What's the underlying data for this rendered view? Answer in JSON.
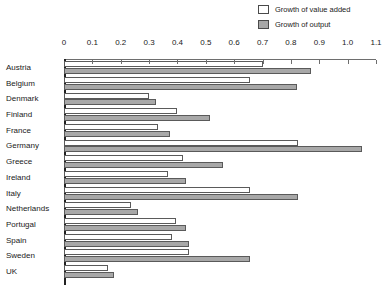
{
  "chart_data": {
    "type": "bar",
    "orientation": "horizontal",
    "title": "",
    "xlabel": "",
    "ylabel": "",
    "xlim": [
      0,
      1.1
    ],
    "grid": false,
    "legend_position": "top-right",
    "tick_labels": [
      "0",
      "0.1",
      "0.2",
      "0.3",
      "0.4",
      "0.5",
      "0.6",
      "0.7",
      "0.8",
      "0.9",
      "1.0",
      "1.1"
    ],
    "tick_values": [
      0,
      0.1,
      0.2,
      0.3,
      0.4,
      0.5,
      0.6,
      0.7,
      0.8,
      0.9,
      1.0,
      1.1
    ],
    "categories": [
      "Austria",
      "Belgium",
      "Denmark",
      "Finland",
      "France",
      "Germany",
      "Greece",
      "Ireland",
      "Italy",
      "Netherlands",
      "Portugal",
      "Spain",
      "Sweden",
      "UK"
    ],
    "series": [
      {
        "name": "Growth of value added",
        "color": "#ffffff",
        "values": [
          0.7,
          0.655,
          0.3,
          0.4,
          0.33,
          0.825,
          0.42,
          0.365,
          0.655,
          0.235,
          0.395,
          0.38,
          0.44,
          0.155
        ]
      },
      {
        "name": "Growth of output",
        "color": "#a8a8a8",
        "values": [
          0.87,
          0.82,
          0.325,
          0.515,
          0.375,
          1.05,
          0.56,
          0.43,
          0.825,
          0.26,
          0.43,
          0.44,
          0.655,
          0.175
        ]
      }
    ]
  },
  "legend": {
    "items": [
      {
        "label": "Growth of value added",
        "swatch": "value-added"
      },
      {
        "label": "Growth of output",
        "swatch": "output"
      }
    ]
  }
}
